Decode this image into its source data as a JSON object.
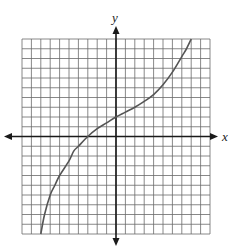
{
  "chart_data": {
    "type": "line",
    "title": "",
    "xlabel": "x",
    "ylabel": "y",
    "xlim": [
      -10,
      10
    ],
    "ylim": [
      -10,
      10
    ],
    "grid": true,
    "grid_step": 1,
    "tick_labels": false,
    "series": [
      {
        "name": "curve",
        "color": "#555555",
        "x": [
          -8,
          -7.6,
          -7,
          -6.5,
          -6,
          -5,
          -4.5,
          -4,
          -3,
          -2,
          -1,
          0,
          1,
          2,
          3,
          4,
          5,
          6,
          7,
          7.5,
          8
        ],
        "y": [
          -10,
          -8,
          -6,
          -5,
          -4,
          -2.5,
          -1.5,
          -1,
          0,
          0.8,
          1.4,
          2,
          2.5,
          3,
          3.6,
          4.3,
          5.3,
          6.6,
          8.2,
          9,
          10
        ]
      }
    ]
  },
  "colors": {
    "grid": "#6a6a6a",
    "axis": "#1a1a1a",
    "curve": "#555555"
  }
}
